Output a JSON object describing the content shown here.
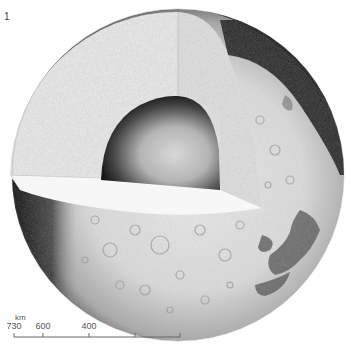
{
  "figure": {
    "number": "1"
  },
  "scale_bar": {
    "unit": "km",
    "ticks": [
      {
        "label": "730",
        "x": 14
      },
      {
        "label": "600",
        "x": 43
      },
      {
        "label": "400",
        "x": 89
      },
      {
        "label": "",
        "x": 135
      },
      {
        "label": "",
        "x": 180
      }
    ]
  },
  "colors": {
    "background": "#ffffff",
    "surface_light": "#e4e4e4",
    "surface_shadow": "#1a1a1a",
    "cut_face": "#ececec",
    "cut_floor": "#f6f6f6",
    "core_light": "#cfcfcf",
    "core_dark": "#1c1c1c",
    "maria": "#5a5a5a"
  }
}
